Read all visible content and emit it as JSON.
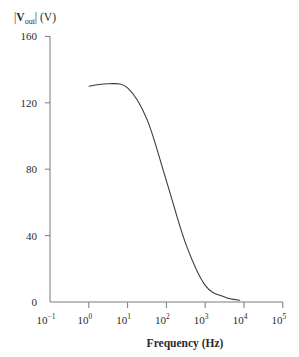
{
  "chart_data": {
    "type": "line",
    "title": "",
    "xlabel": "Frequency (Hz)",
    "ylabel": "|V_out| (V)",
    "ylabel_parts": {
      "prefix": "|",
      "main": "V",
      "sub": "out",
      "suffix": "| (V)"
    },
    "xscale": "log",
    "xlim": [
      0.1,
      100000
    ],
    "ylim": [
      0,
      160
    ],
    "x_ticks": [
      {
        "exp": "-1",
        "value": 0.1
      },
      {
        "exp": "0",
        "value": 1
      },
      {
        "exp": "1",
        "value": 10
      },
      {
        "exp": "2",
        "value": 100
      },
      {
        "exp": "3",
        "value": 1000
      },
      {
        "exp": "4",
        "value": 10000
      },
      {
        "exp": "5",
        "value": 100000
      }
    ],
    "y_ticks": [
      0,
      40,
      80,
      120,
      160
    ],
    "grid": false,
    "legend": null,
    "series": [
      {
        "name": "|V_out|",
        "color": "#3a3a3a",
        "x": [
          1,
          3.16,
          10,
          31.6,
          100,
          316,
          1000,
          3160,
          8000
        ],
        "values": [
          130,
          131.5,
          129,
          110,
          73,
          35,
          10,
          3,
          1
        ]
      }
    ]
  },
  "colors": {
    "axis": "#7a7a7a",
    "curve": "#3a3a3a",
    "text": "#2a2a2a"
  }
}
